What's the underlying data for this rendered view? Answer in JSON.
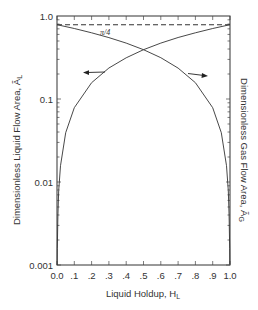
{
  "chart_data": {
    "type": "line",
    "title": "",
    "xlabel": "Liquid Holdup, H_L",
    "ylabel_left": "Dimensionless Liquid Flow Area, Ã_L",
    "ylabel_right": "Dimensionless Gas Flow Area, Ã_G",
    "xlim": [
      0.0,
      1.0
    ],
    "ylim": [
      0.001,
      1.0
    ],
    "yscale": "log",
    "grid": false,
    "x_tick_labels": [
      "0.0",
      ".1",
      ".2",
      ".3",
      ".4",
      ".5",
      ".6",
      ".7",
      ".8",
      ".9",
      "1.0"
    ],
    "y_tick_labels": [
      "1.0",
      "0.1",
      "0.01",
      "0.001"
    ],
    "x": [
      0.0013,
      0.002,
      0.005,
      0.01,
      0.02,
      0.05,
      0.1,
      0.2,
      0.3,
      0.4,
      0.5,
      0.6,
      0.7,
      0.8,
      0.9,
      1.0
    ],
    "series": [
      {
        "name": "Ã_L (left axis)",
        "values": [
          0.001,
          0.00157,
          0.00393,
          0.00785,
          0.0157,
          0.0393,
          0.0785,
          0.157,
          0.236,
          0.314,
          0.393,
          0.471,
          0.55,
          0.628,
          0.707,
          0.785
        ]
      },
      {
        "name": "Ã_G (right axis)",
        "values": [
          0.784,
          0.784,
          0.781,
          0.777,
          0.77,
          0.746,
          0.707,
          0.628,
          0.55,
          0.471,
          0.393,
          0.314,
          0.236,
          0.157,
          0.0785,
          0.0
        ]
      },
      {
        "name": "π/4 reference (dashed)",
        "values": [
          0.785,
          0.785,
          0.785,
          0.785,
          0.785,
          0.785,
          0.785,
          0.785,
          0.785,
          0.785,
          0.785,
          0.785,
          0.785,
          0.785,
          0.785,
          0.785
        ]
      }
    ],
    "annotations": [
      {
        "text": "π/4",
        "near": "dashed line, x≈0.25"
      },
      {
        "text": "left arrow",
        "meaning": "Ã_L curve reads on left axis",
        "at_x": 0.27
      },
      {
        "text": "right arrow",
        "meaning": "Ã_G curve reads on right axis",
        "at_x": 0.76
      }
    ],
    "legend": "none"
  },
  "labels": {
    "x_title": "Liquid Holdup, H",
    "x_title_sub": "L",
    "y_left_title": "Dimensionless Liquid Flow Area, Ã",
    "y_left_sub": "L",
    "y_right_title": "Dimensionless Gas Flow Area, Ã",
    "y_right_sub": "G",
    "pi_over_4": "π/4",
    "y_ticks": [
      {
        "label": "1.0",
        "y": 16
      },
      {
        "label": "0.1",
        "y": 99
      },
      {
        "label": "0.01",
        "y": 182
      },
      {
        "label": "0.001",
        "y": 265
      }
    ],
    "x_ticks": [
      "0.0",
      ".1",
      ".2",
      ".3",
      ".4",
      ".5",
      ".6",
      ".7",
      ".8",
      ".9",
      "1.0"
    ]
  }
}
